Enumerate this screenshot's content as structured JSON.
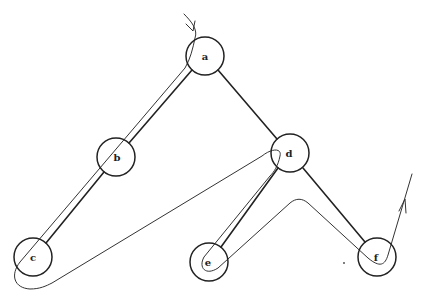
{
  "diagram": {
    "title": "",
    "type": "binary tree with traversal path",
    "nodes": [
      {
        "id": "a",
        "label": "a",
        "x": 205,
        "y": 56,
        "r": 19
      },
      {
        "id": "b",
        "label": "b",
        "x": 116,
        "y": 157,
        "r": 19
      },
      {
        "id": "c",
        "label": "c",
        "x": 33,
        "y": 257,
        "r": 19
      },
      {
        "id": "d",
        "label": "d",
        "x": 290,
        "y": 153,
        "r": 19
      },
      {
        "id": "e",
        "label": "e",
        "x": 209,
        "y": 262,
        "r": 19
      },
      {
        "id": "f",
        "label": "f",
        "x": 377,
        "y": 257,
        "r": 19
      }
    ],
    "edges": [
      {
        "from": "a",
        "to": "b"
      },
      {
        "from": "b",
        "to": "c"
      },
      {
        "from": "a",
        "to": "d"
      },
      {
        "from": "d",
        "to": "e"
      },
      {
        "from": "d",
        "to": "f"
      }
    ],
    "traversal": {
      "description": "Curve entering at a from top with arrow, tracing around left subtree, crossing to d, around e, up and over to f, exiting upward with arrow",
      "start_arrow": "down",
      "end_arrow": "up"
    },
    "colors": {
      "line": "#222222",
      "background": "#ffffff"
    }
  }
}
